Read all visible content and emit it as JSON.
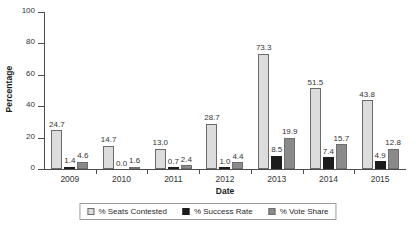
{
  "chart_data": {
    "type": "bar",
    "title": "",
    "xlabel": "Date",
    "ylabel": "Percentage",
    "categories": [
      "2009",
      "2010",
      "2011",
      "2012",
      "2013",
      "2014",
      "2015"
    ],
    "ylim": [
      0,
      100
    ],
    "yticks": [
      0,
      20,
      40,
      60,
      80,
      100
    ],
    "ytick_labels": [
      "0",
      "20",
      "40",
      "60",
      "80",
      "100"
    ],
    "grid": false,
    "legend_position": "bottom",
    "series": [
      {
        "name": "% Seats Contested",
        "color": "#dcdcdc",
        "values": [
          24.7,
          14.7,
          13.0,
          28.7,
          73.3,
          51.5,
          43.8
        ],
        "labels": [
          "24.7",
          "14.7",
          "13.0",
          "28.7",
          "73.3",
          "51.5",
          "43.8"
        ]
      },
      {
        "name": "% Success Rate",
        "color": "#1c1c1c",
        "values": [
          1.4,
          0.0,
          0.7,
          1.0,
          8.5,
          7.4,
          4.9
        ],
        "labels": [
          "1.4",
          "0.0",
          "0.7",
          "1.0",
          "8.5",
          "7.4",
          "4.9"
        ]
      },
      {
        "name": "% Vote Share",
        "color": "#8a8a8a",
        "values": [
          4.6,
          1.6,
          2.4,
          4.4,
          19.9,
          15.7,
          12.8
        ],
        "labels": [
          "4.6",
          "1.6",
          "2.4",
          "4.4",
          "19.9",
          "15.7",
          "12.8"
        ]
      }
    ]
  }
}
